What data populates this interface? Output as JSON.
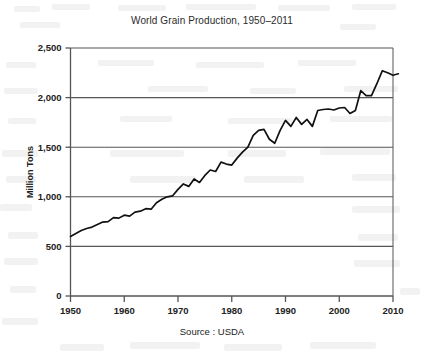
{
  "chart_data": {
    "type": "line",
    "title": "World Grain Production, 1950–2011",
    "xlabel": "",
    "ylabel": "Million Tons",
    "source": "Source : USDA",
    "xlim": [
      1950,
      2011
    ],
    "ylim": [
      0,
      2500
    ],
    "grid": true,
    "legend": "none",
    "line_color": "#111111",
    "axis_color": "#555555",
    "xticks": [
      1950,
      1960,
      1970,
      1980,
      1990,
      2000,
      2010
    ],
    "xtick_labels": [
      "1950",
      "1960",
      "1970",
      "1980",
      "1990",
      "2000",
      "2010"
    ],
    "yticks": [
      0,
      500,
      1000,
      1500,
      2000,
      2500
    ],
    "ytick_labels": [
      "0",
      "500",
      "1,000",
      "1,500",
      "2,000",
      "2,500"
    ],
    "series": [
      {
        "name": "World grain production",
        "x": [
          1950,
          1951,
          1952,
          1953,
          1954,
          1955,
          1956,
          1957,
          1958,
          1959,
          1960,
          1961,
          1962,
          1963,
          1964,
          1965,
          1966,
          1967,
          1968,
          1969,
          1970,
          1971,
          1972,
          1973,
          1974,
          1975,
          1976,
          1977,
          1978,
          1979,
          1980,
          1981,
          1982,
          1983,
          1984,
          1985,
          1986,
          1987,
          1988,
          1989,
          1990,
          1991,
          1992,
          1993,
          1994,
          1995,
          1996,
          1997,
          1998,
          1999,
          2000,
          2001,
          2002,
          2003,
          2004,
          2005,
          2006,
          2007,
          2008,
          2009,
          2010,
          2011
        ],
        "values": [
          600,
          630,
          660,
          680,
          695,
          720,
          745,
          750,
          790,
          785,
          815,
          805,
          845,
          855,
          880,
          875,
          940,
          975,
          1000,
          1010,
          1075,
          1130,
          1105,
          1180,
          1145,
          1215,
          1270,
          1255,
          1350,
          1330,
          1320,
          1390,
          1450,
          1500,
          1620,
          1670,
          1680,
          1580,
          1540,
          1670,
          1770,
          1710,
          1800,
          1730,
          1780,
          1710,
          1870,
          1880,
          1885,
          1875,
          1895,
          1900,
          1840,
          1870,
          2070,
          2020,
          2020,
          2140,
          2270,
          2250,
          2225,
          2240
        ]
      }
    ],
    "annotations": []
  }
}
